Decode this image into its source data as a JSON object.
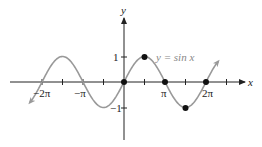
{
  "chart_data": {
    "type": "line",
    "title": "",
    "function_label": "y = sin x",
    "xlabel": "x",
    "ylabel": "y",
    "x_tick_labels": [
      "−2π",
      "−π",
      "π",
      "2π"
    ],
    "y_tick_labels": [
      "1",
      "−1"
    ],
    "xlim": [
      -9.42,
      8.64
    ],
    "ylim": [
      -2.3,
      2.6
    ],
    "grid": false,
    "series": [
      {
        "name": "y = sin x",
        "color": "#999999",
        "x_range": [
          -7.07,
          7.07
        ]
      }
    ],
    "highlighted_points": [
      {
        "x": "0",
        "y": 0
      },
      {
        "x": "π/2",
        "y": 1
      },
      {
        "x": "π",
        "y": 0
      },
      {
        "x": "3π/2",
        "y": -1
      },
      {
        "x": "2π",
        "y": 0
      }
    ]
  },
  "labels": {
    "x_axis": "x",
    "y_axis": "y",
    "func": "y = sin x",
    "neg2pi": "−2π",
    "negpi": "−π",
    "pi": "π",
    "twopi": "2π",
    "one": "1",
    "negone": "−1"
  }
}
